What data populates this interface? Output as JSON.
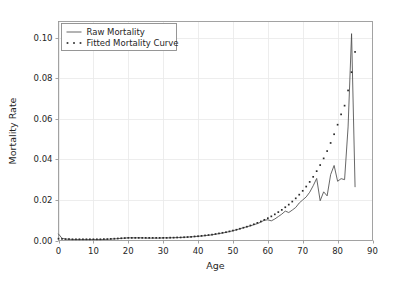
{
  "chart_data": {
    "type": "line",
    "title": "",
    "xlabel": "Age",
    "ylabel": "Mortality Rate",
    "xlim": [
      0,
      90
    ],
    "ylim": [
      0.0,
      0.108
    ],
    "xticks": [
      0,
      10,
      20,
      30,
      40,
      50,
      60,
      70,
      80,
      90
    ],
    "xticklabels": [
      "0",
      "10",
      "20",
      "30",
      "40",
      "50",
      "60",
      "70",
      "80",
      "90"
    ],
    "yticks": [
      0.0,
      0.02,
      0.04,
      0.06,
      0.08,
      0.1
    ],
    "yticklabels": [
      "0.00",
      "0.02",
      "0.04",
      "0.06",
      "0.08",
      "0.10"
    ],
    "grid": true,
    "legend_position": "upper left",
    "colors": {
      "raw": "#4c4c4c",
      "fitted": "#2b2b2b",
      "grid": "#e8e8e8",
      "frame": "#999999",
      "background": "#ffffff"
    },
    "series": [
      {
        "name": "Raw Mortality",
        "style": "line",
        "x": [
          0,
          1,
          2,
          3,
          4,
          5,
          6,
          7,
          8,
          9,
          10,
          11,
          12,
          13,
          14,
          15,
          16,
          17,
          18,
          19,
          20,
          21,
          22,
          23,
          24,
          25,
          26,
          27,
          28,
          29,
          30,
          31,
          32,
          33,
          34,
          35,
          36,
          37,
          38,
          39,
          40,
          41,
          42,
          43,
          44,
          45,
          46,
          47,
          48,
          49,
          50,
          51,
          52,
          53,
          54,
          55,
          56,
          57,
          58,
          59,
          60,
          61,
          62,
          63,
          64,
          65,
          66,
          67,
          68,
          69,
          70,
          71,
          72,
          73,
          74,
          75,
          76,
          77,
          78,
          79,
          80,
          81,
          82,
          83,
          84,
          85
        ],
        "y": [
          0.0032,
          0.0011,
          0.0007,
          0.0006,
          0.0005,
          0.0005,
          0.0005,
          0.0005,
          0.0005,
          0.0005,
          0.0005,
          0.0005,
          0.0005,
          0.0005,
          0.0006,
          0.0007,
          0.0008,
          0.0009,
          0.0011,
          0.0012,
          0.0013,
          0.0013,
          0.0013,
          0.0013,
          0.0013,
          0.0012,
          0.0012,
          0.0012,
          0.0012,
          0.0012,
          0.0013,
          0.0013,
          0.0013,
          0.0014,
          0.0014,
          0.0015,
          0.0016,
          0.0017,
          0.0018,
          0.0019,
          0.0021,
          0.0022,
          0.0024,
          0.0026,
          0.0028,
          0.0031,
          0.0034,
          0.0037,
          0.004,
          0.0044,
          0.0048,
          0.0053,
          0.0058,
          0.0063,
          0.0068,
          0.0072,
          0.0078,
          0.0083,
          0.0091,
          0.01,
          0.0102,
          0.0097,
          0.0106,
          0.0118,
          0.013,
          0.0145,
          0.0138,
          0.015,
          0.0163,
          0.0185,
          0.02,
          0.0215,
          0.0238,
          0.027,
          0.0306,
          0.0196,
          0.024,
          0.022,
          0.0325,
          0.037,
          0.0292,
          0.0305,
          0.03,
          0.056,
          0.102,
          0.0265
        ]
      },
      {
        "name": "Fitted Mortality Curve",
        "style": "markers",
        "x": [
          0,
          1,
          2,
          3,
          4,
          5,
          6,
          7,
          8,
          9,
          10,
          11,
          12,
          13,
          14,
          15,
          16,
          17,
          18,
          19,
          20,
          21,
          22,
          23,
          24,
          25,
          26,
          27,
          28,
          29,
          30,
          31,
          32,
          33,
          34,
          35,
          36,
          37,
          38,
          39,
          40,
          41,
          42,
          43,
          44,
          45,
          46,
          47,
          48,
          49,
          50,
          51,
          52,
          53,
          54,
          55,
          56,
          57,
          58,
          59,
          60,
          61,
          62,
          63,
          64,
          65,
          66,
          67,
          68,
          69,
          70,
          71,
          72,
          73,
          74,
          75,
          76,
          77,
          78,
          79,
          80,
          81,
          82,
          83,
          84,
          85
        ],
        "y": [
          0.0009,
          0.0008,
          0.0007,
          0.0007,
          0.0006,
          0.0006,
          0.0006,
          0.0006,
          0.0006,
          0.0006,
          0.0006,
          0.0006,
          0.0006,
          0.0007,
          0.0007,
          0.0008,
          0.0009,
          0.001,
          0.0011,
          0.0012,
          0.0013,
          0.0013,
          0.0013,
          0.0013,
          0.0013,
          0.0013,
          0.0013,
          0.0013,
          0.0013,
          0.0013,
          0.0013,
          0.0013,
          0.0014,
          0.0014,
          0.0015,
          0.0015,
          0.0016,
          0.0017,
          0.0018,
          0.002,
          0.0021,
          0.0023,
          0.0025,
          0.0027,
          0.0029,
          0.0032,
          0.0035,
          0.0038,
          0.0041,
          0.0045,
          0.0049,
          0.0053,
          0.0058,
          0.0063,
          0.0068,
          0.0074,
          0.008,
          0.0087,
          0.0094,
          0.0102,
          0.011,
          0.0119,
          0.0129,
          0.014,
          0.0151,
          0.0164,
          0.0177,
          0.0192,
          0.0208,
          0.0226,
          0.0245,
          0.0266,
          0.0289,
          0.0314,
          0.0342,
          0.0372,
          0.0405,
          0.0441,
          0.0481,
          0.0524,
          0.0571,
          0.0622,
          0.0665,
          0.074,
          0.083,
          0.093
        ]
      }
    ]
  },
  "legend": {
    "entries": [
      {
        "label": "Raw Mortality",
        "marker": "line"
      },
      {
        "label": "Fitted Mortality Curve",
        "marker": "dots"
      }
    ]
  },
  "axes": {
    "x_title": "Age",
    "y_title": "Mortality Rate"
  }
}
